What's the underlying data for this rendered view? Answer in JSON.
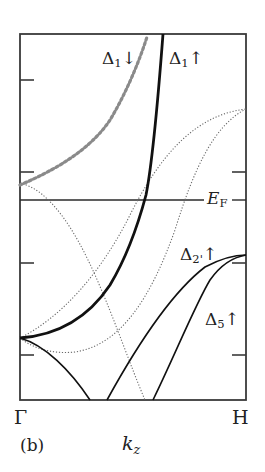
{
  "figure": {
    "panel_label": "(b)",
    "x_axis": {
      "variable": "k",
      "variable_subscript": "z",
      "start_point": "Γ",
      "end_point": "H"
    },
    "fermi_level": {
      "symbol": "E",
      "subscript": "F"
    },
    "band_labels": [
      {
        "id": "delta1-down",
        "symbol": "Δ",
        "subscript": "1",
        "spin": "↓"
      },
      {
        "id": "delta1-up",
        "symbol": "Δ",
        "subscript": "1",
        "spin": "↑"
      },
      {
        "id": "delta2prime-up",
        "symbol": "Δ",
        "subscript": "2'",
        "spin": "↑"
      },
      {
        "id": "delta5-up",
        "symbol": "Δ",
        "subscript": "5",
        "spin": "↑"
      }
    ],
    "colors": {
      "frame": "#3a3a3a",
      "solid_band": "#111111",
      "thick_dotted_band": "#8a8a8a",
      "thin_dotted_band": "#6a6a6a",
      "fermi_line": "#2a2a2a"
    }
  }
}
